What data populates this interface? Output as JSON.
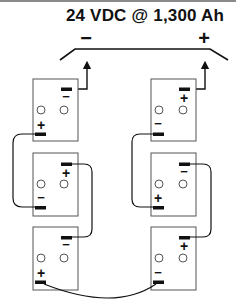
{
  "title": "24 VDC @ 1,300 Ah",
  "output": {
    "negative_label": "−",
    "positive_label": "+"
  },
  "colors": {
    "stroke": "#111111",
    "box": "#555555",
    "top_rule": "#8a8a8a"
  },
  "batteries": [
    {
      "id": "left-top",
      "top_label": "−",
      "bottom_label": "+"
    },
    {
      "id": "left-middle",
      "top_label": "+",
      "bottom_label": "−"
    },
    {
      "id": "left-bottom",
      "top_label": "−",
      "bottom_label": "+"
    },
    {
      "id": "right-top",
      "top_label": "+",
      "bottom_label": "−"
    },
    {
      "id": "right-middle",
      "top_label": "−",
      "bottom_label": "+"
    },
    {
      "id": "right-bottom",
      "top_label": "+",
      "bottom_label": "−"
    }
  ]
}
